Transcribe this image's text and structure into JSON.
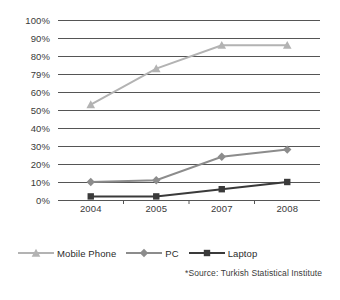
{
  "chart_data": {
    "type": "line",
    "title": "",
    "subtitle": "",
    "xlabel": "",
    "ylabel": "",
    "categories": [
      "2004",
      "2005",
      "2007",
      "2008"
    ],
    "series": [
      {
        "name": "Mobile Phone",
        "marker": "triangle",
        "color": "#b3b3b3",
        "values": [
          53,
          73,
          86,
          86
        ]
      },
      {
        "name": "PC",
        "marker": "diamond",
        "color": "#8c8c8c",
        "values": [
          10,
          11,
          24,
          28
        ]
      },
      {
        "name": "Laptop",
        "marker": "square",
        "color": "#3a3a3a",
        "values": [
          2,
          2,
          6,
          10
        ]
      }
    ],
    "ylim": [
      0,
      100
    ],
    "y_ticks": [
      "0%",
      "10%",
      "20%",
      "30%",
      "40%",
      "50%",
      "79%",
      "80%",
      "90%",
      "100%"
    ],
    "y_tick_values": [
      0,
      10,
      20,
      30,
      40,
      50,
      60,
      80,
      90,
      100
    ],
    "y_tick_labels_top_down": [
      "100%",
      "90%",
      "80%",
      "79%",
      "60%",
      "50%",
      "40%",
      "30%",
      "20%",
      "10%",
      "0%"
    ],
    "grid": true,
    "legend_position": "bottom-left",
    "annotations": [
      "*Source: Turkish Statistical Institute"
    ]
  },
  "axes": {
    "y_labels": [
      {
        "text": "100%",
        "value": 100
      },
      {
        "text": "90%",
        "value": 90
      },
      {
        "text": "80%",
        "value": 80
      },
      {
        "text": "79%",
        "value": 70
      },
      {
        "text": "60%",
        "value": 60
      },
      {
        "text": "50%",
        "value": 50
      },
      {
        "text": "40%",
        "value": 40
      },
      {
        "text": "30%",
        "value": 30
      },
      {
        "text": "20%",
        "value": 20
      },
      {
        "text": "10%",
        "value": 10
      },
      {
        "text": "0%",
        "value": 0
      }
    ],
    "x_labels": [
      "2004",
      "2005",
      "2007",
      "2008"
    ]
  },
  "legend": {
    "items": [
      {
        "label": "Mobile Phone",
        "marker": "triangle",
        "color": "#b3b3b3"
      },
      {
        "label": "PC",
        "marker": "diamond",
        "color": "#8c8c8c"
      },
      {
        "label": "Laptop",
        "marker": "square",
        "color": "#3a3a3a"
      }
    ]
  },
  "footer": {
    "source": "*Source: Turkish Statistical Institute"
  },
  "colors": {
    "gridline": "#555555",
    "background": "#ffffff",
    "text": "#2b2b2b"
  }
}
